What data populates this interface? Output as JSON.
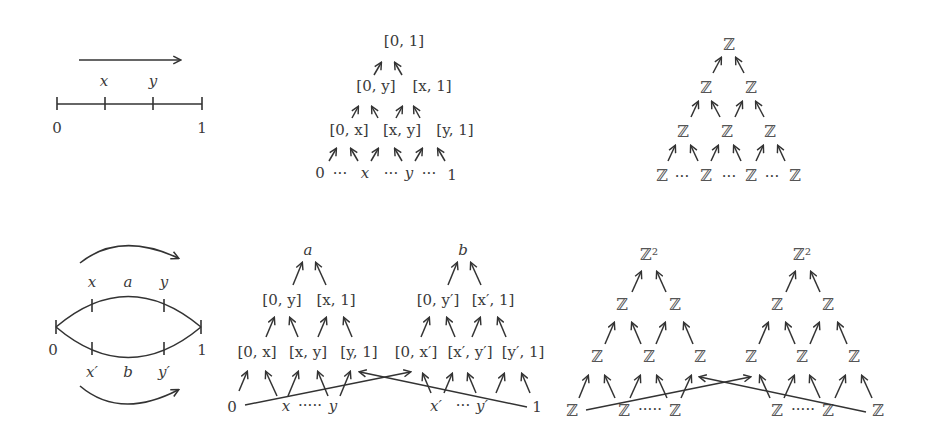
{
  "figure": {
    "top_row": {
      "interval": {
        "labels": {
          "x": "x",
          "y": "y",
          "zero": "0",
          "one": "1"
        },
        "direction": "right-arrow"
      },
      "poset": {
        "level0": [
          "[0, 1]"
        ],
        "level1": [
          "[0, y]",
          "[x, 1]"
        ],
        "level2": [
          "[0, x]",
          "[x, y]",
          "[y, 1]"
        ],
        "level3": [
          "0",
          "···",
          "x",
          "···",
          "y",
          "···",
          "1"
        ]
      },
      "homology": {
        "level0": [
          "ℤ"
        ],
        "level1": [
          "ℤ",
          "ℤ"
        ],
        "level2": [
          "ℤ",
          "ℤ",
          "ℤ"
        ],
        "level3": [
          "ℤ",
          "···",
          "ℤ",
          "···",
          "ℤ",
          "···",
          "ℤ"
        ]
      }
    },
    "bottom_row": {
      "circle": {
        "labels": {
          "x": "x",
          "a": "a",
          "y": "y",
          "zero": "0",
          "one": "1",
          "xp": "x′",
          "b": "b",
          "yp": "y′"
        }
      },
      "poset_a": {
        "level0": [
          "a"
        ],
        "level1": [
          "[0, y]",
          "[x, 1]"
        ],
        "level2": [
          "[0, x]",
          "[x, y]",
          "[y, 1]"
        ],
        "level3": [
          "0",
          "x",
          "·····",
          "y"
        ]
      },
      "poset_b": {
        "level0": [
          "b"
        ],
        "level1": [
          "[0, y′]",
          "[x′, 1]"
        ],
        "level2": [
          "[0, x′]",
          "[x′, y′]",
          "[y′, 1]"
        ],
        "level3": [
          "x′",
          "···",
          "y′",
          "1"
        ]
      },
      "homology_a": {
        "level0": [
          "ℤ²"
        ],
        "level1": [
          "ℤ",
          "ℤ"
        ],
        "level2": [
          "ℤ",
          "ℤ",
          "ℤ"
        ],
        "level3": [
          "ℤ",
          "ℤ",
          "·····",
          "ℤ"
        ]
      },
      "homology_b": {
        "level0": [
          "ℤ²"
        ],
        "level1": [
          "ℤ",
          "ℤ"
        ],
        "level2": [
          "ℤ",
          "ℤ",
          "ℤ"
        ],
        "level3": [
          "ℤ",
          "·····",
          "ℤ",
          "ℤ"
        ]
      }
    }
  }
}
